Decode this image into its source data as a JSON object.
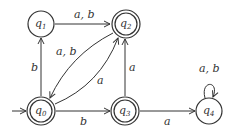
{
  "diagram": {
    "type": "finite-automaton",
    "start_state": "q0",
    "states": [
      {
        "id": "q0",
        "label": "q",
        "sub": "0",
        "x": 41,
        "y": 111,
        "accepting": true
      },
      {
        "id": "q1",
        "label": "q",
        "sub": "1",
        "x": 41,
        "y": 24,
        "accepting": false
      },
      {
        "id": "q2",
        "label": "q",
        "sub": "2",
        "x": 126,
        "y": 24,
        "accepting": true
      },
      {
        "id": "q3",
        "label": "q",
        "sub": "3",
        "x": 125,
        "y": 111,
        "accepting": true
      },
      {
        "id": "q4",
        "label": "q",
        "sub": "4",
        "x": 209,
        "y": 111,
        "accepting": false
      }
    ],
    "transitions": [
      {
        "from": "q0",
        "to": "q1",
        "label": "b"
      },
      {
        "from": "q1",
        "to": "q2",
        "label": "a, b"
      },
      {
        "from": "q2",
        "to": "q0",
        "label": "a, b"
      },
      {
        "from": "q0",
        "to": "q2",
        "label": "a"
      },
      {
        "from": "q3",
        "to": "q2",
        "label": "a"
      },
      {
        "from": "q0",
        "to": "q3",
        "label": "b"
      },
      {
        "from": "q3",
        "to": "q4",
        "label": "a"
      },
      {
        "from": "q4",
        "to": "q4",
        "label": "a, b"
      }
    ],
    "colors": {
      "stroke": "#333333",
      "background": "#ffffff"
    }
  }
}
